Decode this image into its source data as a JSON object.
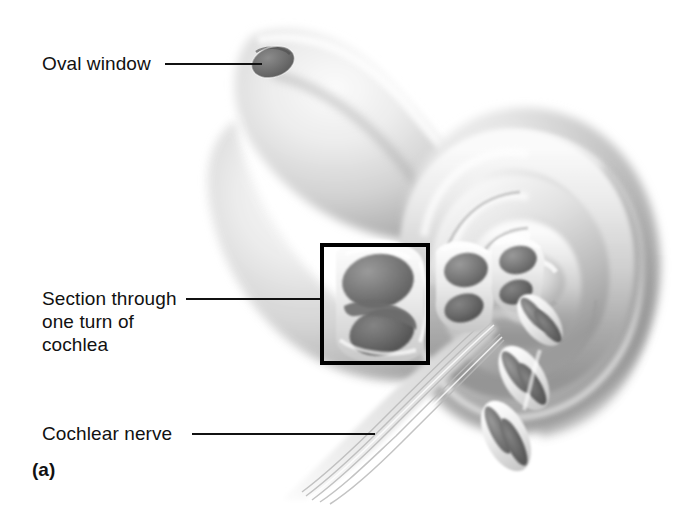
{
  "figure": {
    "panel_letter": "(a)",
    "background_color": "#ffffff",
    "ink_color": "#111111",
    "style": "grayscale-airbrush-anatomical-illustration",
    "width": 689,
    "height": 514
  },
  "labels": [
    {
      "id": "oval-window",
      "text": "Oval window",
      "leader": {
        "x1": 165,
        "y1": 64,
        "x2": 262,
        "y2": 64
      }
    },
    {
      "id": "section-through-one-turn-of-cochlea",
      "text": "Section through\none turn of\ncochlea",
      "leader": {
        "x1": 186,
        "y1": 299,
        "x2": 322,
        "y2": 299
      }
    },
    {
      "id": "cochlear-nerve",
      "text": "Cochlear nerve",
      "leader": {
        "x1": 192,
        "y1": 434,
        "x2": 375,
        "y2": 434
      }
    }
  ],
  "callout_box": {
    "name": "section-highlight-box",
    "x": 322,
    "y": 245,
    "width": 106,
    "height": 118,
    "stroke": "#000000",
    "stroke_width": 4
  },
  "structures": {
    "oval_window": {
      "name": "oval-window-aperture",
      "cx": 273,
      "cy": 62,
      "rx": 22,
      "ry": 15,
      "rotation": -18,
      "fill": "#6e6e6e"
    },
    "vestibule_lobe": {
      "name": "vestibule-lobe"
    },
    "cochlear_spiral": {
      "name": "cochlear-spiral-turns",
      "turn_count": 3,
      "center_x": 505,
      "center_y": 285
    },
    "cochlear_nerve_bundle": {
      "name": "cochlear-nerve-bundle",
      "fiber_count": 9
    },
    "cross_sections": {
      "name": "cochlear-duct-cross-sections",
      "count": 6,
      "description": "cut-away oval scala sections along the spiral"
    }
  },
  "palette": {
    "white": "#ffffff",
    "light_gray": "#e8e8e8",
    "mid_gray": "#b4b4b4",
    "shadow_gray": "#8a8a8a",
    "dark_gray": "#6a6a6a",
    "deep_gray": "#4f4f4f",
    "outline_black": "#000000"
  }
}
